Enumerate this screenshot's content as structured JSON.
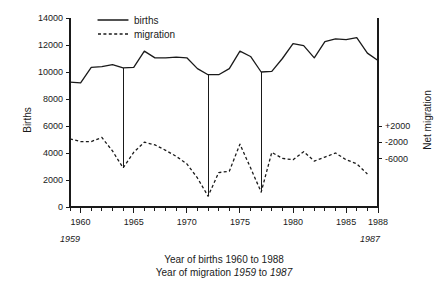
{
  "chart_data": {
    "type": "line",
    "title": "",
    "xlabel": "Year of births 1960 to 1988 / Year of migration 1959 to 1987",
    "ylabel": "Births",
    "y2label": "Net migration",
    "grid": false,
    "legend_position": "top-left",
    "x": [
      1959,
      1960,
      1961,
      1962,
      1963,
      1964,
      1965,
      1966,
      1967,
      1968,
      1969,
      1970,
      1971,
      1972,
      1973,
      1974,
      1975,
      1976,
      1977,
      1978,
      1979,
      1980,
      1981,
      1982,
      1983,
      1984,
      1985,
      1986,
      1987,
      1988
    ],
    "xlim": [
      1959,
      1988
    ],
    "ylim": [
      0,
      14000
    ],
    "y2lim": [
      -8000,
      4000
    ],
    "xticks": [
      1960,
      1965,
      1970,
      1975,
      1980,
      1985,
      1988
    ],
    "xticklabels": [
      "1960",
      "1965",
      "1970",
      "1975",
      "1980",
      "1985",
      "1988"
    ],
    "xminorticks": [
      1959,
      1961,
      1962,
      1963,
      1964,
      1966,
      1967,
      1968,
      1969,
      1971,
      1972,
      1973,
      1974,
      1976,
      1977,
      1978,
      1979,
      1981,
      1982,
      1983,
      1984,
      1986,
      1987
    ],
    "yticks": [
      0,
      2000,
      4000,
      6000,
      8000,
      10000,
      12000,
      14000
    ],
    "yticklabels": [
      "0",
      "2000",
      "4000",
      "6000",
      "8000",
      "10000",
      "12000",
      "14000"
    ],
    "y2ticks": [
      2000,
      -2000,
      -6000
    ],
    "y2ticklabels": [
      "+2000",
      "-2000",
      "-6000"
    ],
    "edge_labels": {
      "left_below": "1959",
      "right_below": "1987"
    },
    "series": [
      {
        "name": "births",
        "style": "solid",
        "color": "#1a1a1a",
        "values": [
          9250,
          9200,
          10350,
          10400,
          10550,
          10300,
          10350,
          11550,
          11050,
          11050,
          11100,
          11050,
          10250,
          9800,
          9800,
          10250,
          11550,
          11150,
          10000,
          10050,
          11000,
          12100,
          11950,
          11050,
          12250,
          12450,
          12400,
          12550,
          11400,
          10850
        ]
      },
      {
        "name": "migration",
        "style": "dashed",
        "color": "#1a1a1a",
        "values_births_scale": [
          5050,
          4850,
          4850,
          5150,
          4150,
          2900,
          4050,
          4800,
          4600,
          4200,
          3750,
          3200,
          2150,
          800,
          2550,
          2650,
          4650,
          2900,
          1100,
          4050,
          3600,
          3500,
          4100,
          3400,
          3700,
          4000,
          3500,
          3200,
          2450
        ],
        "values_net_migration": [
          -2950,
          -3150,
          -3150,
          -2850,
          -3850,
          -5100,
          -3950,
          -3200,
          -3400,
          -3800,
          -4250,
          -4800,
          -5850,
          -7200,
          -5450,
          -5350,
          -3350,
          -5100,
          -6900,
          -3950,
          -4400,
          -4500,
          -3900,
          -4600,
          -4300,
          -4000,
          -4500,
          -4800,
          -5550
        ]
      }
    ],
    "connector_years": [
      1964,
      1972,
      1977
    ],
    "annotations": []
  },
  "legend": {
    "items": [
      {
        "label": "births",
        "style": "solid"
      },
      {
        "label": "migration",
        "style": "dashed"
      }
    ]
  },
  "caption": {
    "line1_prefix": "Year of births 1960 to 1988",
    "line2_a": "Year of migration ",
    "line2_b": "1959",
    "line2_c": " to ",
    "line2_d": "1987"
  }
}
